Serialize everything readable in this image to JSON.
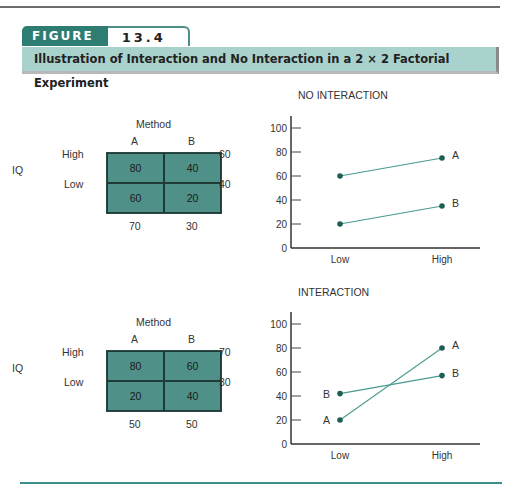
{
  "figure": {
    "label": "FIGURE",
    "number": "13.4",
    "caption": "Illustration of Interaction and No Interaction in a 2 × 2 Factorial Experiment"
  },
  "tables": [
    {
      "factor_label": "Method",
      "row_factor": "IQ",
      "col_labels": [
        "A",
        "B"
      ],
      "row_labels": [
        "High",
        "Low"
      ],
      "cells": [
        [
          "80",
          "40"
        ],
        [
          "60",
          "20"
        ]
      ],
      "row_means": [
        "60",
        "40"
      ],
      "col_means": [
        "70",
        "30"
      ]
    },
    {
      "factor_label": "Method",
      "row_factor": "IQ",
      "col_labels": [
        "A",
        "B"
      ],
      "row_labels": [
        "High",
        "Low"
      ],
      "cells": [
        [
          "80",
          "60"
        ],
        [
          "20",
          "40"
        ]
      ],
      "row_means": [
        "70",
        "30"
      ],
      "col_means": [
        "50",
        "50"
      ]
    }
  ],
  "colors": {
    "accent": "#2e7d72",
    "cell_fill": "#4f9088",
    "caption_band": "#a9d2cc",
    "line": "#4a9a90",
    "point": "#1f5e57"
  },
  "chart_data": [
    {
      "type": "line",
      "title": "NO INTERACTION",
      "categories": [
        "Low",
        "High"
      ],
      "xlabel": "",
      "ylabel": "",
      "ylim": [
        0,
        100
      ],
      "yticks": [
        "0",
        "20",
        "40",
        "60",
        "80",
        "100"
      ],
      "grid": false,
      "series": [
        {
          "name": "A",
          "values": [
            60,
            75
          ]
        },
        {
          "name": "B",
          "values": [
            20,
            35
          ]
        }
      ]
    },
    {
      "type": "line",
      "title": "INTERACTION",
      "categories": [
        "Low",
        "High"
      ],
      "xlabel": "",
      "ylabel": "",
      "ylim": [
        0,
        100
      ],
      "yticks": [
        "0",
        "20",
        "40",
        "60",
        "80",
        "100"
      ],
      "grid": false,
      "series": [
        {
          "name": "A",
          "values": [
            20,
            80
          ]
        },
        {
          "name": "B",
          "values": [
            42,
            57
          ]
        }
      ]
    }
  ]
}
